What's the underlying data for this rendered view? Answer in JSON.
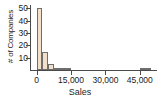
{
  "chart_data": {
    "type": "bar",
    "title": "",
    "subtitle": "",
    "xlabel": "Sales",
    "ylabel": "# of Companies",
    "xlim": [
      -2500,
      52500
    ],
    "ylim": [
      0,
      52
    ],
    "grid": false,
    "legend": null,
    "bin_width": 2500,
    "annotations": [],
    "x_ticks": [
      {
        "value": 0,
        "label": "0"
      },
      {
        "value": 15000,
        "label": "15,000"
      },
      {
        "value": 30000,
        "label": "30,000"
      },
      {
        "value": 45000,
        "label": "45,000"
      }
    ],
    "y_ticks": [
      {
        "value": 10,
        "label": "10"
      },
      {
        "value": 20,
        "label": "20"
      },
      {
        "value": 30,
        "label": "30"
      },
      {
        "value": 40,
        "label": "40"
      },
      {
        "value": 50,
        "label": "50"
      }
    ],
    "bins": [
      {
        "x0": 0,
        "x1": 2500,
        "value": 50
      },
      {
        "x0": 2500,
        "x1": 5000,
        "value": 15
      },
      {
        "x0": 5000,
        "x1": 7500,
        "value": 5
      },
      {
        "x0": 7500,
        "x1": 10000,
        "value": 2
      },
      {
        "x0": 10000,
        "x1": 12500,
        "value": 1
      },
      {
        "x0": 12500,
        "x1": 15000,
        "value": 2
      },
      {
        "x0": 15000,
        "x1": 17500,
        "value": 0
      },
      {
        "x0": 17500,
        "x1": 20000,
        "value": 0
      },
      {
        "x0": 20000,
        "x1": 22500,
        "value": 0
      },
      {
        "x0": 22500,
        "x1": 25000,
        "value": 0
      },
      {
        "x0": 25000,
        "x1": 27500,
        "value": 0
      },
      {
        "x0": 27500,
        "x1": 30000,
        "value": 0
      },
      {
        "x0": 30000,
        "x1": 32500,
        "value": 0
      },
      {
        "x0": 32500,
        "x1": 35000,
        "value": 0
      },
      {
        "x0": 35000,
        "x1": 37500,
        "value": 0
      },
      {
        "x0": 37500,
        "x1": 40000,
        "value": 0
      },
      {
        "x0": 40000,
        "x1": 42500,
        "value": 0
      },
      {
        "x0": 42500,
        "x1": 45000,
        "value": 0
      },
      {
        "x0": 45000,
        "x1": 47500,
        "value": 1
      },
      {
        "x0": 47500,
        "x1": 50000,
        "value": 1
      }
    ],
    "categories": [
      "0-2500",
      "2500-5000",
      "5000-7500",
      "7500-10000",
      "10000-12500",
      "12500-15000",
      "15000-17500",
      "17500-20000",
      "20000-22500",
      "22500-25000",
      "25000-27500",
      "27500-30000",
      "30000-32500",
      "32500-35000",
      "35000-37500",
      "37500-40000",
      "40000-42500",
      "42500-45000",
      "45000-47500",
      "47500-50000"
    ],
    "values": [
      50,
      15,
      5,
      2,
      1,
      2,
      0,
      0,
      0,
      0,
      0,
      0,
      0,
      0,
      0,
      0,
      0,
      0,
      1,
      1
    ],
    "colors": {
      "bar_fill": "#f2e0cb",
      "bar_edge": "#6e6e6e",
      "axis": "#4a4a4a",
      "text": "#1a1a1a",
      "background": "#ffffff"
    }
  }
}
